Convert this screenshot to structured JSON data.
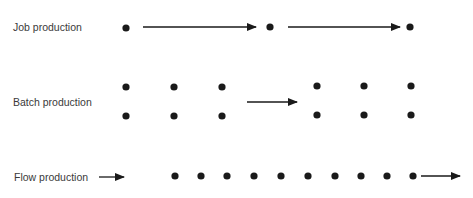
{
  "rows": [
    {
      "id": "job",
      "label": "Job production"
    },
    {
      "id": "batch",
      "label": "Batch production"
    },
    {
      "id": "flow",
      "label": "Flow production"
    }
  ],
  "colors": {
    "ink": "#1a1a1a",
    "label": "#3a3a3a",
    "background": "#ffffff"
  },
  "icons": {
    "dot": "dot-icon",
    "arrow": "arrow-right-icon"
  }
}
